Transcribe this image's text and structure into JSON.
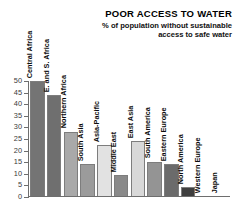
{
  "chart_data": {
    "type": "bar",
    "title": "POOR ACCESS TO WATER",
    "subtitle": "% of population without sustainable access to safe water",
    "xlabel": "",
    "ylabel": "",
    "ylim": [
      0,
      50
    ],
    "ytick_step": 5,
    "grid": false,
    "legend": "none",
    "ytick_labels": [
      "50",
      "45",
      "40",
      "35",
      "30",
      "25",
      "20",
      "15",
      "10",
      "5",
      "0"
    ],
    "categories": [
      "Central Africa",
      "E. and S. Africa",
      "Northern Africa",
      "South Asia",
      "Asia-Pacific",
      "Middle East",
      "East Asia",
      "South America",
      "Eastern Europe",
      "North America",
      "Western Europe",
      "Japan"
    ],
    "values": [
      50,
      44,
      28,
      14,
      22,
      9,
      24,
      15,
      14,
      4,
      0,
      0
    ],
    "bar_colors": [
      "#747474",
      "#6f6f6f",
      "#a9a9a9",
      "#9b9b9b",
      "#e2e2e2",
      "#8a8a8a",
      "#d8d8d8",
      "#949494",
      "#6b6b6b",
      "#3f3f3f",
      "#ffffff",
      "#ffffff"
    ]
  },
  "colors": {
    "axis": "#6e6e6e",
    "title_text": "#000000",
    "background": "#ffffff"
  }
}
